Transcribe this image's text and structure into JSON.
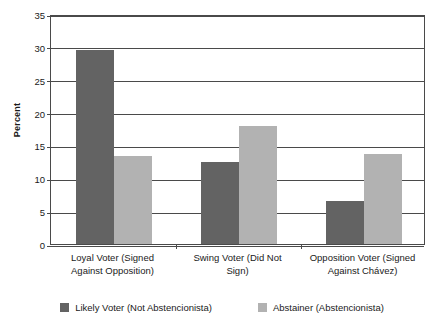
{
  "chart_data": {
    "type": "bar",
    "title": "",
    "subtitle": "",
    "xlabel": "",
    "ylabel": "Percent",
    "ylim": [
      0,
      35
    ],
    "yticks": [
      0,
      5,
      10,
      15,
      20,
      25,
      30,
      35
    ],
    "ytick_labels": [
      "0",
      "5",
      "10",
      "15",
      "20",
      "25",
      "30",
      "35"
    ],
    "grid": true,
    "legend_position": "bottom",
    "categories": [
      "Loyal Voter (Signed Against Opposition)",
      "Swing Voter (Did Not Sign)",
      "Opposition Voter (Signed Against Chávez)"
    ],
    "category_lines": [
      [
        "Loyal Voter (Signed",
        "Against Opposition)"
      ],
      [
        "Swing Voter (Did Not",
        "Sign)"
      ],
      [
        "Opposition Voter (Signed",
        "Against Chávez)"
      ]
    ],
    "series": [
      {
        "name": "Likely Voter (Not Abstencionista)",
        "color": "#636363",
        "values": [
          29.6,
          12.5,
          6.6
        ]
      },
      {
        "name": "Abstainer (Abstencionista)",
        "color": "#b2b2b2",
        "values": [
          13.4,
          17.9,
          13.7
        ]
      }
    ]
  }
}
